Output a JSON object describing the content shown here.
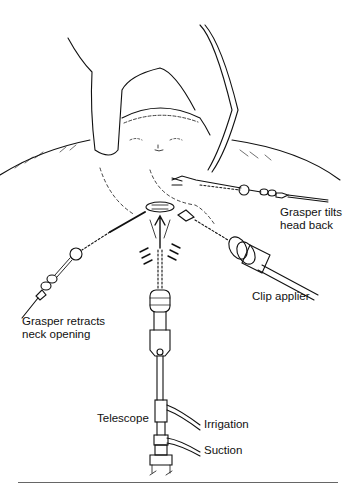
{
  "figure": {
    "labels": {
      "grasper_tilts": [
        "Grasper tilts",
        "head back"
      ],
      "grasper_retracts": [
        "Grasper retracts",
        "neck opening"
      ],
      "clip_applier": "Clip applier",
      "telescope": "Telescope",
      "irrigation": "Irrigation",
      "suction": "Suction"
    },
    "colors": {
      "ink": "#111111",
      "background": "#ffffff"
    }
  }
}
